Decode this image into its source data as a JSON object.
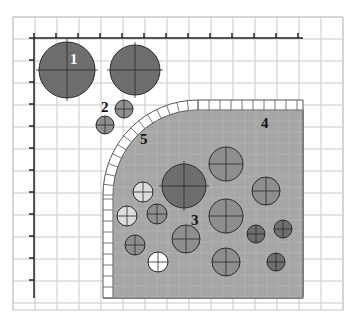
{
  "diagram": {
    "labels": {
      "l1": "1",
      "l2": "2",
      "l3": "3",
      "l4": "4",
      "l5": "5"
    },
    "colors": {
      "background": "#ffffff",
      "grid": "#c8c8c8",
      "axis": "#222222",
      "region_fill": "#a6a6a6",
      "tile_fill": "#ffffff",
      "tile_stroke": "#555555",
      "dark_circle": "#6e6e6e",
      "mid_circle": "#8e8e8e",
      "light_circle": "#dcdcdc",
      "white_circle": "#ffffff",
      "circle_stroke": "#2a2a2a"
    },
    "circles": [
      {
        "id": "c1",
        "cx": 67,
        "cy": 70,
        "r": 28,
        "fill": "dark"
      },
      {
        "id": "c2",
        "cx": 135,
        "cy": 70,
        "r": 25,
        "fill": "dark"
      },
      {
        "id": "c3",
        "cx": 124,
        "cy": 109,
        "r": 9,
        "fill": "mid"
      },
      {
        "id": "c4",
        "cx": 105,
        "cy": 125,
        "r": 9,
        "fill": "mid"
      },
      {
        "id": "c5",
        "cx": 184,
        "cy": 186,
        "r": 22,
        "fill": "dark"
      },
      {
        "id": "c6",
        "cx": 143,
        "cy": 192,
        "r": 10,
        "fill": "light"
      },
      {
        "id": "c7",
        "cx": 127,
        "cy": 216,
        "r": 10,
        "fill": "light"
      },
      {
        "id": "c8",
        "cx": 157,
        "cy": 214,
        "r": 10,
        "fill": "mid"
      },
      {
        "id": "c9",
        "cx": 226,
        "cy": 164,
        "r": 17,
        "fill": "mid"
      },
      {
        "id": "c10",
        "cx": 266,
        "cy": 191,
        "r": 14,
        "fill": "mid"
      },
      {
        "id": "c11",
        "cx": 226,
        "cy": 216,
        "r": 17,
        "fill": "mid"
      },
      {
        "id": "c12",
        "cx": 186,
        "cy": 239,
        "r": 14,
        "fill": "mid"
      },
      {
        "id": "c13",
        "cx": 135,
        "cy": 245,
        "r": 10,
        "fill": "mid"
      },
      {
        "id": "c14",
        "cx": 256,
        "cy": 234,
        "r": 9,
        "fill": "dark"
      },
      {
        "id": "c15",
        "cx": 283,
        "cy": 229,
        "r": 9,
        "fill": "dark"
      },
      {
        "id": "c16",
        "cx": 226,
        "cy": 262,
        "r": 14,
        "fill": "mid"
      },
      {
        "id": "c17",
        "cx": 158,
        "cy": 262,
        "r": 10,
        "fill": "white"
      },
      {
        "id": "c18",
        "cx": 276,
        "cy": 262,
        "r": 9,
        "fill": "dark"
      }
    ]
  }
}
